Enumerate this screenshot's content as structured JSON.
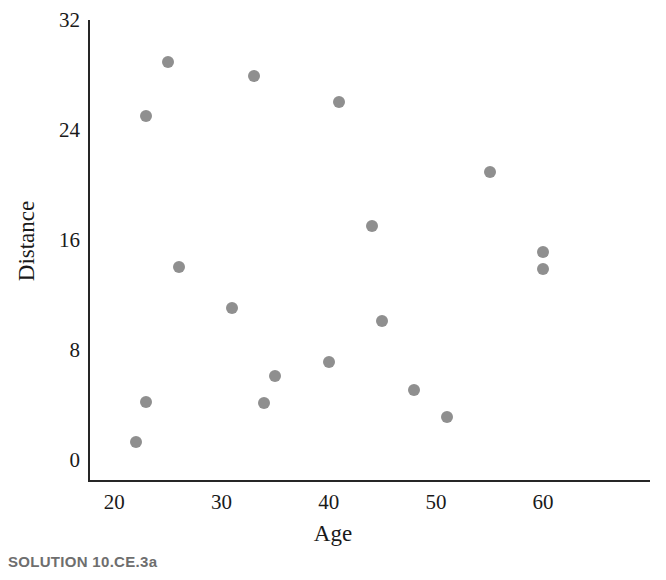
{
  "caption": "SOLUTION 10.CE.3a",
  "style": {
    "point_color": "#8f8f8f",
    "axis_color": "#262626",
    "text_color": "#1a1a1a",
    "caption_color": "#6e6e6e",
    "background": "#ffffff"
  },
  "chart_data": {
    "type": "scatter",
    "title": "",
    "xlabel": "Age",
    "ylabel": "Distance",
    "xlim": [
      18,
      70
    ],
    "ylim": [
      0,
      32
    ],
    "xticks": [
      20,
      30,
      40,
      50,
      60
    ],
    "yticks": [
      0,
      8,
      16,
      24,
      32
    ],
    "xtick_labels": [
      "20",
      "30",
      "40",
      "50",
      "60"
    ],
    "ytick_labels": [
      "0",
      "8",
      "16",
      "24",
      "32"
    ],
    "grid": false,
    "legend": false,
    "points": [
      {
        "x": 22,
        "y": 1.4
      },
      {
        "x": 23,
        "y": 4.3
      },
      {
        "x": 23,
        "y": 25.1
      },
      {
        "x": 25,
        "y": 29.0
      },
      {
        "x": 26,
        "y": 14.1
      },
      {
        "x": 31,
        "y": 11.1
      },
      {
        "x": 33,
        "y": 28.0
      },
      {
        "x": 34,
        "y": 4.2
      },
      {
        "x": 35,
        "y": 6.2
      },
      {
        "x": 40,
        "y": 7.2
      },
      {
        "x": 41,
        "y": 26.1
      },
      {
        "x": 44,
        "y": 17.1
      },
      {
        "x": 45,
        "y": 10.2
      },
      {
        "x": 48,
        "y": 5.2
      },
      {
        "x": 51,
        "y": 3.2
      },
      {
        "x": 55,
        "y": 21.0
      },
      {
        "x": 60,
        "y": 15.2
      },
      {
        "x": 60,
        "y": 14.0
      }
    ]
  }
}
